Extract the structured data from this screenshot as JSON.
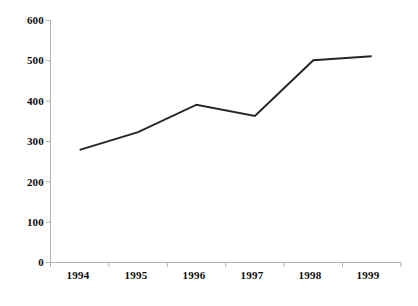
{
  "chart_data": {
    "type": "line",
    "title": "",
    "subtitle": "",
    "xlabel": "",
    "ylabel": "",
    "categories": [
      "1994",
      "1995",
      "1996",
      "1997",
      "1998",
      "1999"
    ],
    "series": [
      {
        "name": "series-1",
        "values": [
          278,
          322,
          390,
          362,
          500,
          510
        ],
        "color": "#262626",
        "line_width": 2
      }
    ],
    "ylim": [
      0,
      600
    ],
    "yticks": [
      0,
      100,
      200,
      300,
      400,
      500,
      600
    ],
    "ytick_labels": [
      "0",
      "100",
      "200",
      "300",
      "400",
      "500",
      "600"
    ],
    "grid": false,
    "legend": null,
    "legend_position": "none",
    "axis_color": "#b0b0b0",
    "marker": "none",
    "annotations": []
  },
  "axes": {
    "y_axis_name": "value-axis",
    "x_axis_name": "year-axis"
  }
}
